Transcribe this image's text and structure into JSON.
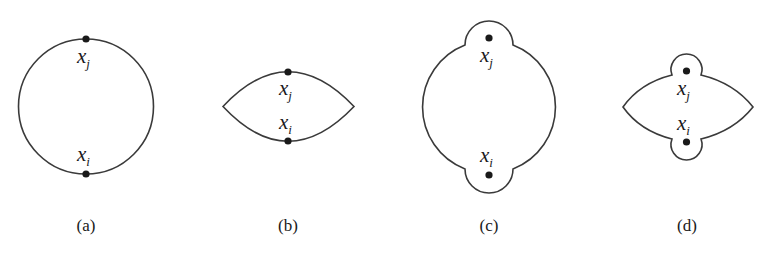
{
  "figure": {
    "panels": [
      {
        "id": "a",
        "caption": "(a)",
        "shape": "circle",
        "points": [
          {
            "var": "x",
            "sub": "j",
            "position": "top"
          },
          {
            "var": "x",
            "sub": "i",
            "position": "bottom"
          }
        ]
      },
      {
        "id": "b",
        "caption": "(b)",
        "shape": "lens",
        "points": [
          {
            "var": "x",
            "sub": "j",
            "position": "top"
          },
          {
            "var": "x",
            "sub": "i",
            "position": "bottom"
          }
        ]
      },
      {
        "id": "c",
        "caption": "(c)",
        "shape": "circle-with-bumps",
        "points": [
          {
            "var": "x",
            "sub": "j",
            "position": "top"
          },
          {
            "var": "x",
            "sub": "i",
            "position": "bottom"
          }
        ]
      },
      {
        "id": "d",
        "caption": "(d)",
        "shape": "lens-with-bumps",
        "points": [
          {
            "var": "x",
            "sub": "j",
            "position": "top"
          },
          {
            "var": "x",
            "sub": "i",
            "position": "bottom"
          }
        ]
      }
    ],
    "colors": {
      "stroke": "#3a3a3a",
      "dot": "#1a1a1a",
      "background": "#ffffff"
    }
  }
}
